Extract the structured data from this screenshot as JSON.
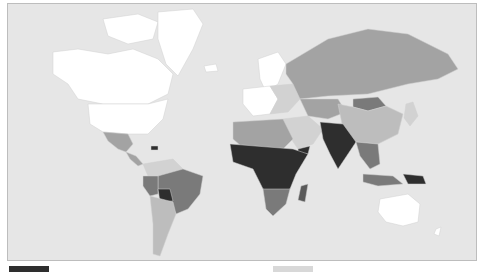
{
  "map": {
    "type": "choropleth",
    "projection": "world",
    "ocean_color": "#e6e6e6",
    "border_color": "#bdbdbd",
    "shades": {
      "lowest": "#ffffff",
      "low": "#d2d2d2",
      "mid_low": "#bdbdbd",
      "mid": "#a3a3a3",
      "mid_high": "#7a7a7a",
      "high": "#5a5a5a",
      "highest": "#2e2e2e"
    },
    "regions": [
      {
        "name": "North America (USA/Canada)",
        "shade": "lowest"
      },
      {
        "name": "Greenland",
        "shade": "lowest"
      },
      {
        "name": "Mexico",
        "shade": "mid"
      },
      {
        "name": "Central America",
        "shade": "mid"
      },
      {
        "name": "Haiti",
        "shade": "highest"
      },
      {
        "name": "Colombia/Venezuela",
        "shade": "low"
      },
      {
        "name": "Brazil",
        "shade": "mid_high"
      },
      {
        "name": "Peru",
        "shade": "mid_high"
      },
      {
        "name": "Bolivia",
        "shade": "highest"
      },
      {
        "name": "Argentina/Chile",
        "shade": "mid_low"
      },
      {
        "name": "Western Europe",
        "shade": "lowest"
      },
      {
        "name": "Scandinavia",
        "shade": "lowest"
      },
      {
        "name": "Eastern Europe",
        "shade": "low"
      },
      {
        "name": "Russia",
        "shade": "mid"
      },
      {
        "name": "Central Asia",
        "shade": "mid"
      },
      {
        "name": "Mongolia",
        "shade": "mid_high"
      },
      {
        "name": "China",
        "shade": "mid_low"
      },
      {
        "name": "Middle East",
        "shade": "low"
      },
      {
        "name": "Yemen",
        "shade": "highest"
      },
      {
        "name": "India/Pakistan",
        "shade": "highest"
      },
      {
        "name": "Southeast Asia",
        "shade": "mid_high"
      },
      {
        "name": "Papua New Guinea",
        "shade": "highest"
      },
      {
        "name": "Japan/Korea",
        "shade": "low"
      },
      {
        "name": "North Africa",
        "shade": "mid"
      },
      {
        "name": "Sub-Saharan Africa",
        "shade": "highest"
      },
      {
        "name": "Southern Africa",
        "shade": "mid_high"
      },
      {
        "name": "Madagascar",
        "shade": "high"
      },
      {
        "name": "Australia",
        "shade": "lowest"
      },
      {
        "name": "New Zealand",
        "shade": "lowest"
      }
    ]
  },
  "legend": {
    "swatches": [
      {
        "color": "#2e2e2e",
        "position": "left"
      },
      {
        "color": "#d8d8d8",
        "position": "right"
      }
    ]
  }
}
